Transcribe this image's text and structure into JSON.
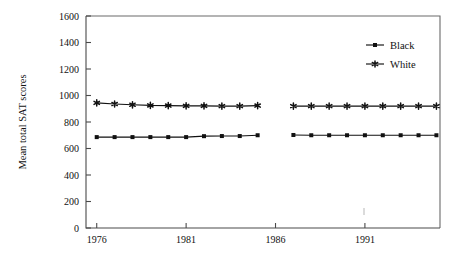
{
  "chart_data": {
    "type": "line",
    "title": "",
    "xlabel": "",
    "ylabel": "Mean total SAT scores",
    "xlim": [
      1975.4,
      1995.2
    ],
    "ylim": [
      0,
      1600
    ],
    "xticks": [
      1976,
      1981,
      1986,
      1991
    ],
    "xticklabels": [
      "1976",
      "1981",
      "1986",
      "1991"
    ],
    "yticks": [
      0,
      200,
      400,
      600,
      800,
      1000,
      1200,
      1400,
      1600
    ],
    "yticklabels": [
      "0",
      "200",
      "400",
      "600",
      "800",
      "1000",
      "1200",
      "1400",
      "1600"
    ],
    "grid": false,
    "legend_position": "top-right",
    "series": [
      {
        "name": "Black",
        "marker": "square",
        "color": "#111111",
        "segments": [
          {
            "x": [
              1976,
              1977,
              1978,
              1979,
              1980,
              1981,
              1982,
              1983,
              1984,
              1985
            ],
            "y": [
              686,
              686,
              686,
              686,
              686,
              686,
              693,
              694,
              694,
              700
            ]
          },
          {
            "x": [
              1987,
              1988,
              1989,
              1990,
              1991,
              1992,
              1993,
              1994,
              1995
            ],
            "y": [
              702,
              700,
              700,
              700,
              700,
              700,
              700,
              700,
              700
            ]
          }
        ]
      },
      {
        "name": "White",
        "marker": "star",
        "color": "#111111",
        "segments": [
          {
            "x": [
              1976,
              1977,
              1978,
              1979,
              1980,
              1981,
              1982,
              1983,
              1984,
              1985
            ],
            "y": [
              944,
              936,
              930,
              925,
              924,
              922,
              922,
              920,
              920,
              924
            ]
          },
          {
            "x": [
              1987,
              1988,
              1989,
              1990,
              1991,
              1992,
              1993,
              1994,
              1995
            ],
            "y": [
              920,
              920,
              920,
              920,
              920,
              920,
              920,
              920,
              920
            ]
          }
        ]
      }
    ]
  },
  "legend": {
    "entries": [
      {
        "label": "Black",
        "marker": "square"
      },
      {
        "label": "White",
        "marker": "star"
      }
    ]
  },
  "axes": {
    "ylabel": "Mean total SAT scores"
  }
}
